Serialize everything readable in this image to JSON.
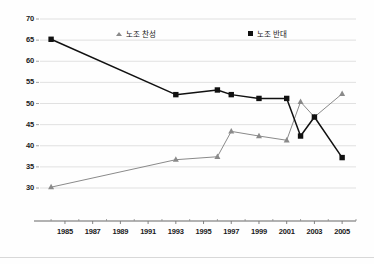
{
  "chart_data": {
    "type": "line",
    "title": "",
    "subtitle": "",
    "xlabel": "",
    "ylabel": "",
    "xlim": [
      1983.2,
      2006.0
    ],
    "ylim": [
      30,
      70
    ],
    "yticks": [
      30,
      35,
      40,
      45,
      50,
      55,
      60,
      65,
      70
    ],
    "xticks": [
      1985,
      1987,
      1989,
      1991,
      1993,
      1995,
      1997,
      1999,
      2001,
      2003,
      2005
    ],
    "grid": true,
    "legend_position": "top-inside",
    "x": [
      1984,
      1993,
      1996,
      1997,
      1999,
      2001,
      2002,
      2003,
      2005
    ],
    "series": [
      {
        "name": "노조 찬성",
        "color": "#8a8a8a",
        "marker": "triangle",
        "values": [
          30.2,
          36.7,
          37.4,
          43.4,
          42.3,
          41.3,
          50.4,
          46.8,
          52.3
        ]
      },
      {
        "name": "노조 반대",
        "color": "#111111",
        "marker": "square",
        "values": [
          65.2,
          52.1,
          53.2,
          52.1,
          51.2,
          51.2,
          42.3,
          46.8,
          37.2
        ]
      }
    ]
  },
  "axis": {
    "y_tick_labels": [
      "70",
      "65",
      "60",
      "55",
      "50",
      "45",
      "40",
      "35",
      "30"
    ],
    "x_tick_labels": [
      "1985",
      "1987",
      "1989",
      "1991",
      "1993",
      "1995",
      "1997",
      "1999",
      "2001",
      "2003",
      "2005"
    ]
  },
  "legend": {
    "entries": [
      {
        "label": "노조 찬성",
        "marker": "triangle-marker-icon"
      },
      {
        "label": "노조 반대",
        "marker": "square-marker-icon"
      }
    ]
  },
  "colors": {
    "series_support": "#8a8a8a",
    "series_oppose": "#111111",
    "grid": "#d9d9d9",
    "axis": "#555555",
    "text": "#1a1a1a",
    "background": "#fefefe"
  }
}
